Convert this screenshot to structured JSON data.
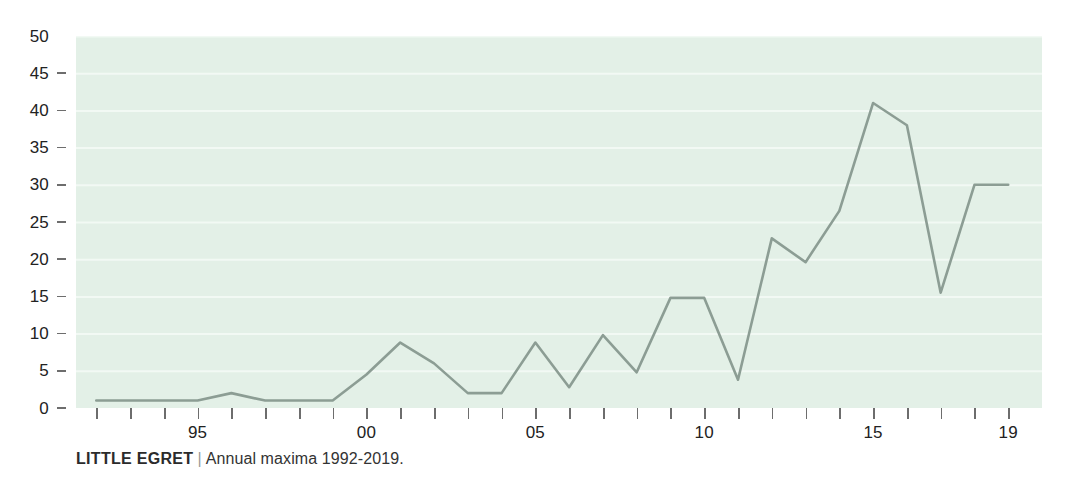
{
  "caption": {
    "species": "LITTLE EGRET",
    "separator": "|",
    "subtitle": "Annual maxima 1992-2019."
  },
  "colors": {
    "plot_background": "#e3f0e7",
    "gridline": "#f2f9f4",
    "series_line": "#8c9d94",
    "tick": "#6d6d6d",
    "text": "#222222"
  },
  "chart_data": {
    "type": "line",
    "title": "LITTLE EGRET",
    "subtitle": "Annual maxima 1992-2019.",
    "xlabel": "",
    "ylabel": "",
    "xlim": [
      1991.4,
      2020.0
    ],
    "ylim": [
      0,
      50
    ],
    "grid": true,
    "legend": "none",
    "x_tick_labels": [
      {
        "value": 1995,
        "label": "95"
      },
      {
        "value": 2000,
        "label": "00"
      },
      {
        "value": 2005,
        "label": "05"
      },
      {
        "value": 2010,
        "label": "10"
      },
      {
        "value": 2015,
        "label": "15"
      },
      {
        "value": 2019,
        "label": "19"
      }
    ],
    "x_minor_ticks": [
      1992,
      1993,
      1994,
      1995,
      1996,
      1997,
      1998,
      1999,
      2000,
      2001,
      2002,
      2003,
      2004,
      2005,
      2006,
      2007,
      2008,
      2009,
      2010,
      2011,
      2012,
      2013,
      2014,
      2015,
      2016,
      2017,
      2018,
      2019
    ],
    "y_tick_labels": [
      "0",
      "5",
      "10",
      "15",
      "20",
      "25",
      "30",
      "35",
      "40",
      "45",
      "50"
    ],
    "y_ticks": [
      0,
      5,
      10,
      15,
      20,
      25,
      30,
      35,
      40,
      45,
      50
    ],
    "x": [
      1992,
      1993,
      1994,
      1995,
      1996,
      1997,
      1998,
      1999,
      2000,
      2001,
      2002,
      2003,
      2004,
      2005,
      2006,
      2007,
      2008,
      2009,
      2010,
      2011,
      2012,
      2013,
      2014,
      2015,
      2016,
      2017,
      2018,
      2019
    ],
    "values": [
      1,
      1,
      1,
      1,
      2,
      1,
      1,
      1,
      4.5,
      8.8,
      6,
      2,
      2,
      8.8,
      2.8,
      9.8,
      4.8,
      14.8,
      14.8,
      3.8,
      22.8,
      19.6,
      26.5,
      41,
      38,
      15.5,
      30,
      30
    ],
    "series": [
      {
        "name": "Little Egret annual maxima",
        "values": [
          1,
          1,
          1,
          1,
          2,
          1,
          1,
          1,
          4.5,
          8.8,
          6,
          2,
          2,
          8.8,
          2.8,
          9.8,
          4.8,
          14.8,
          14.8,
          3.8,
          22.8,
          19.6,
          26.5,
          41,
          38,
          15.5,
          30,
          30
        ]
      }
    ]
  }
}
